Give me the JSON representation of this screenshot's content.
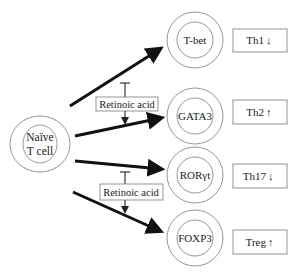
{
  "source": {
    "label_line1": "Naïve",
    "label_line2": "T cell"
  },
  "regulator": {
    "label": "Retinoic acid",
    "instances": 2
  },
  "transcription_factors": [
    {
      "label": "T-bet"
    },
    {
      "label": "GATA3"
    },
    {
      "label": "RORγt"
    },
    {
      "label": "FOXP3"
    }
  ],
  "outcomes": [
    {
      "label": "Th1",
      "direction": "down",
      "arrow": "↓"
    },
    {
      "label": "Th2",
      "direction": "up",
      "arrow": "↑"
    },
    {
      "label": "Th17",
      "direction": "down",
      "arrow": "↓"
    },
    {
      "label": "Treg",
      "direction": "up",
      "arrow": "↑"
    }
  ],
  "regulators": [
    {
      "label": "Retinoic acid",
      "inhibits": "T-bet path",
      "promotes": "GATA3 path"
    },
    {
      "label": "Retinoic acid",
      "inhibits": "RORγt path",
      "promotes": "FOXP3 path"
    }
  ],
  "colors": {
    "arrow": "#111111",
    "outline": "#8a8a8a",
    "text": "#222222",
    "background": "#ffffff"
  }
}
